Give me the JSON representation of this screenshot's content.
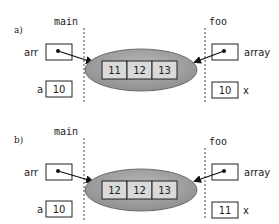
{
  "colors": {
    "ellipse_fill": "#a6a6a6",
    "ellipse_stroke": "#7a7a7a",
    "cell_fill": "#d9d9d9",
    "stroke": "#222222",
    "background": "#ffffff"
  },
  "panels": [
    {
      "label": "a)",
      "left_frame": {
        "name": "main",
        "pointer_var": "arr",
        "value_var": "a",
        "value": "10"
      },
      "right_frame": {
        "name": "foo",
        "pointer_var": "array",
        "value_var": "x",
        "value": "10"
      },
      "array_cells": [
        "11",
        "12",
        "13"
      ]
    },
    {
      "label": "b)",
      "left_frame": {
        "name": "main",
        "pointer_var": "arr",
        "value_var": "a",
        "value": "10"
      },
      "right_frame": {
        "name": "foo",
        "pointer_var": "array",
        "value_var": "x",
        "value": "11"
      },
      "array_cells": [
        "12",
        "12",
        "13"
      ]
    }
  ]
}
